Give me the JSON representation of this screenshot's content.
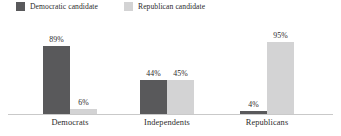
{
  "chart_data": {
    "type": "bar",
    "title": "",
    "subtitle": "",
    "xlabel": "",
    "ylabel": "",
    "ylim": [
      0,
      100
    ],
    "grid": false,
    "legend_position": "top-left",
    "categories": [
      "Democrats",
      "Independents",
      "Republicans"
    ],
    "series": [
      {
        "name": "Democratic candidate",
        "color": "#59595b",
        "values": [
          89,
          44,
          4
        ],
        "labels": [
          "89%",
          "44%",
          "4%"
        ]
      },
      {
        "name": "Republican candidate",
        "color": "#d3d3d4",
        "values": [
          6,
          45,
          95
        ],
        "labels": [
          "6%",
          "45%",
          "95%"
        ]
      }
    ]
  },
  "legend": {
    "items": [
      {
        "label": "Democratic candidate",
        "color": "#59595b"
      },
      {
        "label": "Republican candidate",
        "color": "#d3d3d4"
      }
    ]
  },
  "axis": {
    "baseline_color": "#c9c9c9"
  }
}
